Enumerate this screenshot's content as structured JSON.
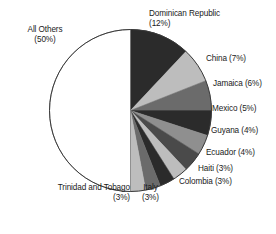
{
  "chart_data": {
    "type": "pie",
    "title": "",
    "subtitle": "",
    "xlabel": "",
    "ylabel": "",
    "legend_position": "none",
    "grid": false,
    "units": "percent",
    "start_angle_deg": 0,
    "direction": "clockwise",
    "slices": [
      {
        "label": "Dominican Republic",
        "value": 12,
        "percent_text": "(12%)",
        "color": "#2b2b2b"
      },
      {
        "label": "China",
        "value": 7,
        "percent_text": "(7%)",
        "color": "#bdbdbd"
      },
      {
        "label": "Jamaica",
        "value": 6,
        "percent_text": "(6%)",
        "color": "#6b6b6b"
      },
      {
        "label": "Mexico",
        "value": 5,
        "percent_text": "(5%)",
        "color": "#2b2b2b"
      },
      {
        "label": "Guyana",
        "value": 4,
        "percent_text": "(4%)",
        "color": "#8f8f8f"
      },
      {
        "label": "Ecuador",
        "value": 4,
        "percent_text": "(4%)",
        "color": "#4a4a4a"
      },
      {
        "label": "Haiti",
        "value": 3,
        "percent_text": "(3%)",
        "color": "#bdbdbd"
      },
      {
        "label": "Colombia",
        "value": 3,
        "percent_text": "(3%)",
        "color": "#2b2b2b"
      },
      {
        "label": "Italy",
        "value": 3,
        "percent_text": "(3%)",
        "color": "#6b6b6b"
      },
      {
        "label": "Trinidad and Tobago",
        "value": 3,
        "percent_text": "(3%)",
        "color": "#bdbdbd"
      },
      {
        "label": "All Others",
        "value": 50,
        "percent_text": "(50%)",
        "color": "#ffffff"
      }
    ],
    "categories": [
      "Dominican Republic",
      "China",
      "Jamaica",
      "Mexico",
      "Guyana",
      "Ecuador",
      "Haiti",
      "Colombia",
      "Italy",
      "Trinidad and Tobago",
      "All Others"
    ],
    "values": [
      12,
      7,
      6,
      5,
      4,
      4,
      3,
      3,
      3,
      3,
      50
    ]
  },
  "labels": {
    "dominican_republic": {
      "name": "Dominican Republic",
      "pct": "(12%)"
    },
    "china": {
      "name": "China (7%)"
    },
    "jamaica": {
      "name": "Jamaica (6%)"
    },
    "mexico": {
      "name": "Mexico (5%)"
    },
    "guyana": {
      "name": "Guyana (4%)"
    },
    "ecuador": {
      "name": "Ecuador (4%)"
    },
    "haiti": {
      "name": "Haiti (3%)"
    },
    "colombia": {
      "name": "Colombia (3%)"
    },
    "italy": {
      "name": "Italy",
      "pct": "(3%)"
    },
    "trinidad": {
      "name": "Trinidad and Tobago",
      "pct": "(3%)"
    },
    "all_others": {
      "name": "All Others",
      "pct": "(50%)"
    }
  },
  "style": {
    "outline_color": "#3a3a3a",
    "text_color": "#1a1a1a",
    "background": "#ffffff"
  }
}
